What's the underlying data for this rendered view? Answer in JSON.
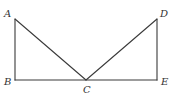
{
  "diagram": {
    "type": "geometry",
    "points": [
      {
        "id": "A",
        "label": "A",
        "x": 15,
        "y": 19,
        "lx": 4,
        "ly": 17
      },
      {
        "id": "B",
        "label": "B",
        "x": 15,
        "y": 80,
        "lx": 4,
        "ly": 85
      },
      {
        "id": "C",
        "label": "C",
        "x": 86,
        "y": 80,
        "lx": 83,
        "ly": 93
      },
      {
        "id": "D",
        "label": "D",
        "x": 157,
        "y": 19,
        "lx": 160,
        "ly": 17
      },
      {
        "id": "E",
        "label": "E",
        "x": 157,
        "y": 80,
        "lx": 161,
        "ly": 85
      }
    ],
    "segments": [
      {
        "from": "A",
        "to": "B"
      },
      {
        "from": "A",
        "to": "C"
      },
      {
        "from": "B",
        "to": "E"
      },
      {
        "from": "C",
        "to": "D"
      },
      {
        "from": "D",
        "to": "E"
      }
    ],
    "colors": {
      "line": "#3a3a3a",
      "label": "#333333",
      "background": "#ffffff"
    }
  }
}
